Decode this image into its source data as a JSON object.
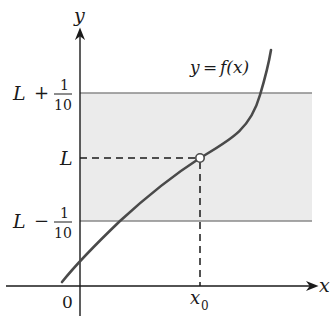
{
  "figure": {
    "type": "epsilon-delta limit illustration",
    "colors": {
      "band_fill": "#ebebeb",
      "band_edge": "#8a8a8a",
      "curve": "#4a4a4a",
      "axis": "#1a1a1a",
      "dash": "#1a1a1a",
      "point_fill": "#ffffff"
    }
  },
  "axes": {
    "x_label": "x",
    "y_label": "y",
    "origin_label": "0"
  },
  "labels": {
    "function": "y = f(x)",
    "function_y": "y",
    "function_eq": "=",
    "function_f": "f(x)",
    "upper_L": "L",
    "upper_op": "+",
    "upper_num": "1",
    "upper_den": "10",
    "middle": "L",
    "lower_L": "L",
    "lower_op": "−",
    "lower_num": "1",
    "lower_den": "10",
    "x0": "x",
    "x0_sub": "0"
  },
  "band": {
    "upper": "L + 1/10",
    "lower": "L − 1/10",
    "center": "L"
  },
  "point": {
    "label": "(x0, L)",
    "style": "open circle"
  }
}
